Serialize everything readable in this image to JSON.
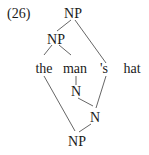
{
  "example_number": "(26)",
  "nodes": {
    "root_np": "NP",
    "inner_np": "NP",
    "word_the": "the",
    "word_man": "man",
    "word_s": "'s",
    "word_hat": "hat",
    "n_upper": "N",
    "n_lower": "N",
    "bottom_np": "NP"
  },
  "edges": [
    [
      "root_np",
      "inner_np"
    ],
    [
      "root_np",
      "word_s"
    ],
    [
      "inner_np",
      "word_the"
    ],
    [
      "inner_np",
      "word_man"
    ],
    [
      "word_man",
      "n_upper"
    ],
    [
      "n_upper",
      "n_lower"
    ],
    [
      "word_s",
      "n_lower"
    ],
    [
      "word_the",
      "bottom_np"
    ],
    [
      "n_lower",
      "bottom_np"
    ]
  ],
  "colors": {
    "text": "#1a1a1a",
    "line": "#555555",
    "background": "#ffffff"
  }
}
